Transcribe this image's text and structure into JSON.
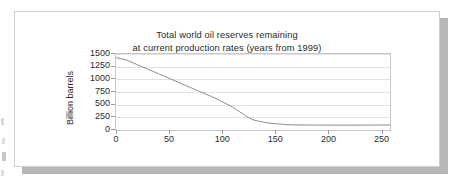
{
  "chart_data": {
    "type": "line",
    "title": "Total world oil reserves remaining at current production rates (years from 1999)",
    "title_line1": "Total world oil reserves remaining",
    "title_line2": "at current production rates (years from 1999)",
    "xlabel": "",
    "ylabel": "Billion barrels",
    "xlim": [
      0,
      258
    ],
    "ylim": [
      0,
      1500
    ],
    "grid": true,
    "legend": false,
    "line_color": "#808080",
    "y_ticks": [
      1500,
      1250,
      1000,
      750,
      500,
      250,
      0
    ],
    "x_ticks": [
      0,
      50,
      100,
      150,
      200,
      250
    ],
    "x": [
      0,
      10,
      20,
      30,
      40,
      50,
      60,
      70,
      80,
      90,
      100,
      110,
      120,
      125,
      130,
      135,
      140,
      145,
      150,
      155,
      160,
      170,
      180,
      190,
      200,
      210,
      220,
      230,
      240,
      250,
      258
    ],
    "values": [
      1430,
      1380,
      1290,
      1200,
      1110,
      1020,
      930,
      840,
      750,
      660,
      560,
      450,
      310,
      240,
      195,
      170,
      150,
      135,
      125,
      115,
      105,
      100,
      98,
      97,
      96,
      96,
      96,
      96,
      97,
      98,
      100
    ],
    "series": [
      {
        "name": "Total world oil reserves remaining",
        "values": [
          1430,
          1380,
          1290,
          1200,
          1110,
          1020,
          930,
          840,
          750,
          660,
          560,
          450,
          310,
          240,
          195,
          170,
          150,
          135,
          125,
          115,
          105,
          100,
          98,
          97,
          96,
          96,
          96,
          96,
          97,
          98,
          100
        ]
      }
    ]
  },
  "page": {
    "card_background": "#ffffff",
    "card_border": "#cfcfcf",
    "shadow_color": "#b7b7b7"
  }
}
